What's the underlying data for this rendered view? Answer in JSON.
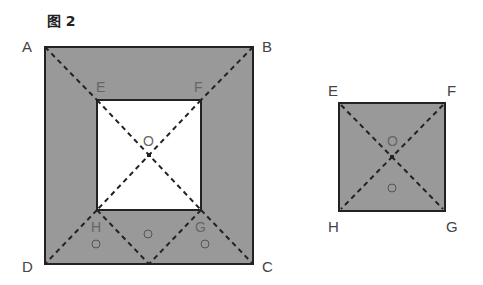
{
  "figure": {
    "title": "图 2",
    "left_figure": {
      "outer_square": [
        "A",
        "B",
        "C",
        "D"
      ],
      "inner_square": [
        "E",
        "F",
        "G",
        "H"
      ],
      "center": "O",
      "fill_color": "#999999",
      "inner_fill_color": "#ffffff",
      "markers": [
        "○",
        "○",
        "○"
      ]
    },
    "right_figure": {
      "square": [
        "E",
        "F",
        "G",
        "H"
      ],
      "center": "O",
      "fill_color": "#999999",
      "markers": [
        "○"
      ]
    }
  }
}
